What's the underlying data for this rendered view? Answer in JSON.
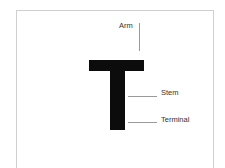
{
  "diagram": {
    "glyph": "T",
    "labels": {
      "arm": "Arm",
      "stem": "Stem",
      "terminal": "Terminal"
    },
    "colors": {
      "glyph": "#0c0c0c",
      "leader": "#9a9a9a",
      "frame": "#cfcfcf",
      "text": "#333333"
    }
  }
}
